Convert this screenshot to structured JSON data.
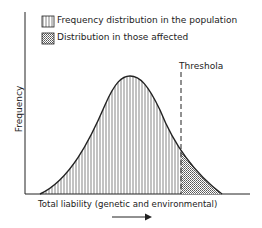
{
  "legend": {
    "items": [
      {
        "label": "Frequency distribution in the population",
        "pattern": "vertical-hatch"
      },
      {
        "label": "Distribution in those affected",
        "pattern": "stipple"
      }
    ]
  },
  "axes": {
    "ylabel": "Frequency",
    "xlabel": "Total liability (genetic and environmental)",
    "x_arrow": "right-arrow-icon"
  },
  "threshold": {
    "label": "Threshola"
  },
  "colors": {
    "ink": "#222222",
    "stipple": "#9a9a9a",
    "background": "#ffffff"
  }
}
